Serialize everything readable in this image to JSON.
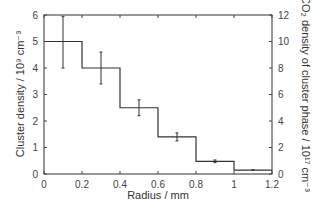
{
  "chart_data": {
    "type": "line",
    "subtype": "step-histogram-with-error-bars",
    "title": "",
    "xlabel": "Radius / mm",
    "ylabel": "Cluster density / 10⁹ cm⁻³",
    "ylabel_right": "CO₂ density of cluster phase / 10¹⁷ cm⁻³",
    "xlim": [
      0,
      1.2
    ],
    "ylim": [
      0,
      6
    ],
    "ylim_right": [
      0,
      12
    ],
    "xticks": [
      0,
      0.2,
      0.4,
      0.6,
      0.8,
      1,
      1.2
    ],
    "xtick_labels": [
      "0",
      "0.2",
      "0.4",
      "0.6",
      "0.8",
      "1",
      "1.2"
    ],
    "yticks": [
      0,
      1,
      2,
      3,
      4,
      5,
      6
    ],
    "ytick_labels": [
      "0",
      "1",
      "2",
      "3",
      "4",
      "5",
      "6"
    ],
    "yticks_right": [
      0,
      2,
      4,
      6,
      8,
      10,
      12
    ],
    "ytick_labels_right": [
      "0",
      "2",
      "4",
      "6",
      "8",
      "10",
      "12"
    ],
    "grid": false,
    "legend": null,
    "bins": [
      {
        "x_start": 0.0,
        "x_end": 0.2,
        "x_center": 0.1,
        "value": 5.0,
        "err_low": 4.0,
        "err_high": 5.95
      },
      {
        "x_start": 0.2,
        "x_end": 0.4,
        "x_center": 0.3,
        "value": 4.0,
        "err_low": 3.4,
        "err_high": 4.6
      },
      {
        "x_start": 0.4,
        "x_end": 0.6,
        "x_center": 0.5,
        "value": 2.5,
        "err_low": 2.2,
        "err_high": 2.8
      },
      {
        "x_start": 0.6,
        "x_end": 0.8,
        "x_center": 0.7,
        "value": 1.4,
        "err_low": 1.25,
        "err_high": 1.55
      },
      {
        "x_start": 0.8,
        "x_end": 1.0,
        "x_center": 0.9,
        "value": 0.48,
        "err_low": 0.43,
        "err_high": 0.53
      },
      {
        "x_start": 1.0,
        "x_end": 1.2,
        "x_center": 1.1,
        "value": 0.15,
        "err_low": 0.14,
        "err_high": 0.16
      }
    ],
    "series": [
      {
        "name": "Cluster density",
        "x": [
          0.1,
          0.3,
          0.5,
          0.7,
          0.9,
          1.1
        ],
        "values": [
          5.0,
          4.0,
          2.5,
          1.4,
          0.48,
          0.15
        ]
      }
    ]
  },
  "labels": {
    "x_axis_title": "Radius / mm",
    "y_axis_title": "Cluster density / 10⁹ cm⁻³",
    "y2_axis_title": "CO₂ density of cluster phase / 10¹⁷ cm⁻³"
  },
  "colors": {
    "line": "#333333",
    "frame": "#444444",
    "background": "#ffffff"
  }
}
